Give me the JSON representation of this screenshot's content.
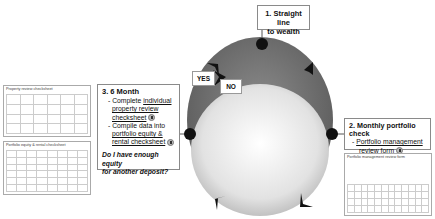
{
  "diagram": {
    "title_step": {
      "line1": "1. Straight line",
      "line2": "to wealth"
    },
    "labels": {
      "yes": "YES",
      "no": "NO"
    },
    "six_month": {
      "heading": "3.  6 Month",
      "item1_prefix": "- Complete ",
      "item1_link_a": "individual",
      "item1_link_b": "property review",
      "item1_link_c": "checksheet",
      "item2_prefix": "- Compile data into",
      "item2_link_a": "portfolio equity &",
      "item2_link_b": "rental checksheet",
      "question_line1": "Do I have enough equity",
      "question_line2": "for another deposit?"
    },
    "monthly": {
      "heading": "2. Monthly portfolio check",
      "item_prefix": "- ",
      "item_link_a": "Portfolio management",
      "item_link_b": "review form"
    },
    "thumbnails": {
      "property_review": {
        "title": "Property review checksheet"
      },
      "portfolio_equity": {
        "title": "Portfolio equity & rental checksheet"
      },
      "portfolio_management": {
        "title": "Portfolio management review form"
      }
    },
    "colors": {
      "outer_ellipse": "#6e6e6e",
      "inner_ellipse": "#e6e6e6",
      "node": "#111111",
      "border": "#8a8a8a"
    }
  }
}
